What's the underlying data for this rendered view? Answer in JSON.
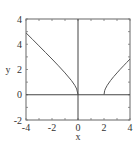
{
  "chart_data": {
    "type": "line",
    "title": "",
    "xlabel": "x",
    "ylabel": "y",
    "xlim": [
      -4,
      4
    ],
    "ylim": [
      -2,
      6
    ],
    "x_ticks": [
      -4,
      -2,
      0,
      2,
      4
    ],
    "x_tick_labels": [
      "-4",
      "-2",
      "0",
      "2",
      "4"
    ],
    "y_ticks": [
      -2,
      0,
      2,
      4,
      6
    ],
    "y_tick_labels": [
      "-2",
      "0",
      "2",
      "4",
      "4"
    ],
    "grid": false,
    "legend": null,
    "reference_lines": {
      "x": 0,
      "y": 0
    },
    "series": [
      {
        "name": "left branch",
        "x": [
          -4,
          -3.5,
          -3,
          -2.5,
          -2,
          -1.5,
          -1,
          -0.5,
          -0.25,
          -0.1,
          0
        ],
        "y": [
          4.9,
          4.39,
          3.87,
          3.35,
          2.83,
          2.29,
          1.73,
          1.12,
          0.75,
          0.46,
          0
        ]
      },
      {
        "name": "right branch",
        "x": [
          2,
          2.05,
          2.1,
          2.25,
          2.5,
          2.75,
          3,
          3.25,
          3.5,
          3.75,
          4
        ],
        "y": [
          0,
          0.32,
          0.46,
          0.75,
          1.12,
          1.44,
          1.73,
          2.02,
          2.29,
          2.56,
          2.83
        ]
      }
    ],
    "colors": {
      "line": "#555555",
      "frame": "#555555",
      "axes": "#444444"
    }
  }
}
